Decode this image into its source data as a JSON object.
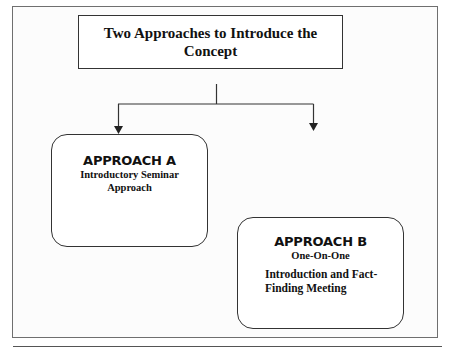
{
  "diagram": {
    "title": "Two Approaches to Introduce the Concept",
    "approaches": [
      {
        "heading": "APPROACH A",
        "subtitle": "Introductory Seminar Approach"
      },
      {
        "heading": "APPROACH B",
        "subtitle": "One-On-One",
        "description": "Introduction and Fact-Finding Meeting"
      }
    ],
    "colors": {
      "line": "#333333",
      "frame": "#6f6f6f",
      "background": "#ffffff"
    }
  }
}
